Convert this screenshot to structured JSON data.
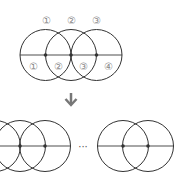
{
  "top_labels": [
    "①",
    "②",
    "③"
  ],
  "bottom_labels": [
    "①",
    "②",
    "③",
    "④"
  ],
  "ellipsis": "···",
  "arrow": "down-arrow",
  "colors": {
    "stroke": "#333333",
    "line": "#777777",
    "label": "#888888",
    "arrow": "#777777"
  }
}
